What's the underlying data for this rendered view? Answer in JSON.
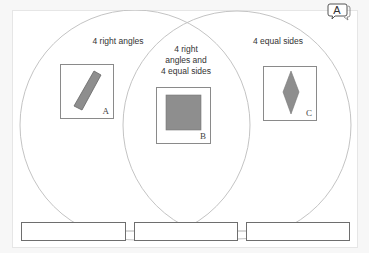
{
  "panel": {
    "background": "#ffffff",
    "border": "#e6e6e6"
  },
  "toolbar": {
    "speech_bubble_label": "A",
    "speech_bubble_icon": "speech-bubble-icon"
  },
  "venn": {
    "circle_color": "#c8c8c8",
    "left_circle": {
      "cx": 135,
      "cy": 125,
      "r": 115
    },
    "right_circle": {
      "cx": 237,
      "cy": 125,
      "r": 114
    },
    "regions": {
      "left": "4 right angles",
      "overlap_line1": "4 right",
      "overlap_line2": "angles and",
      "overlap_line3": "4 equal sides",
      "right": "4 equal sides"
    }
  },
  "cards": [
    {
      "letter": "A",
      "shape": "rectangle",
      "fill": "#8e8e8e"
    },
    {
      "letter": "B",
      "shape": "square",
      "fill": "#8e8e8e"
    },
    {
      "letter": "C",
      "shape": "rhombus",
      "fill": "#8e8e8e"
    }
  ],
  "answer_boxes": [
    {
      "value": ""
    },
    {
      "value": ""
    },
    {
      "value": ""
    }
  ]
}
